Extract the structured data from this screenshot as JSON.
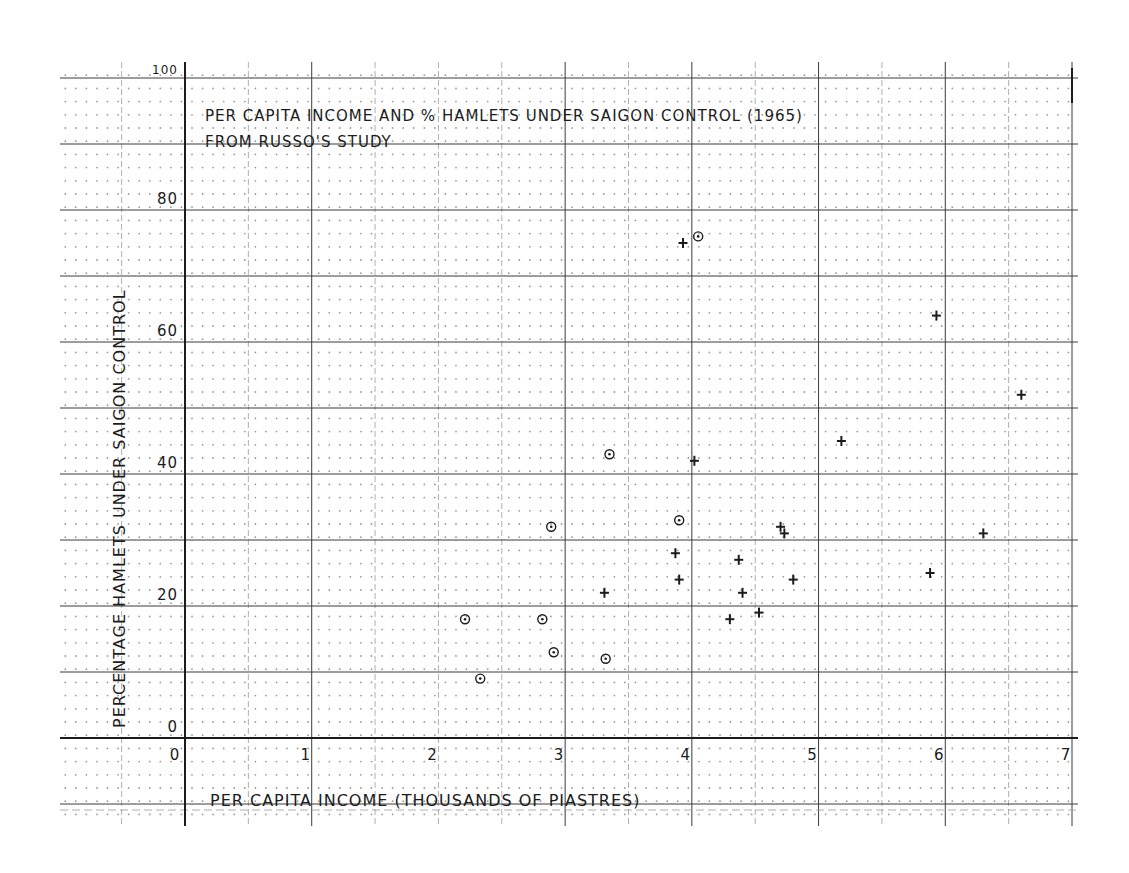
{
  "chart_data": {
    "type": "scatter",
    "title": "PER CAPITA INCOME AND % HAMLETS UNDER SAIGON CONTROL (1965)",
    "subtitle": "FROM RUSSO'S STUDY",
    "xlabel": "PER CAPITA INCOME   (THOUSANDS OF PIASTRES)",
    "ylabel": "PERCENTAGE HAMLETS UNDER SAIGON CONTROL",
    "xlim": [
      0,
      7
    ],
    "ylim": [
      0,
      100
    ],
    "x_ticks": [
      "0",
      "1",
      "2",
      "3",
      "4",
      "5",
      "6",
      "7"
    ],
    "y_ticks": [
      "0",
      "20",
      "40",
      "60",
      "80",
      "100"
    ],
    "grid": true,
    "legend": null,
    "series": [
      {
        "name": "circle-markers",
        "marker": "circle",
        "points": [
          {
            "x": 2.21,
            "y": 18
          },
          {
            "x": 2.33,
            "y": 9
          },
          {
            "x": 2.82,
            "y": 18
          },
          {
            "x": 2.89,
            "y": 32
          },
          {
            "x": 2.91,
            "y": 13
          },
          {
            "x": 3.32,
            "y": 12
          },
          {
            "x": 3.35,
            "y": 43
          },
          {
            "x": 3.9,
            "y": 33
          },
          {
            "x": 4.05,
            "y": 76
          }
        ]
      },
      {
        "name": "plus-markers",
        "marker": "plus",
        "points": [
          {
            "x": 3.31,
            "y": 22
          },
          {
            "x": 3.87,
            "y": 28
          },
          {
            "x": 3.9,
            "y": 24
          },
          {
            "x": 3.93,
            "y": 75
          },
          {
            "x": 4.02,
            "y": 42
          },
          {
            "x": 4.3,
            "y": 18
          },
          {
            "x": 4.37,
            "y": 27
          },
          {
            "x": 4.4,
            "y": 22
          },
          {
            "x": 4.53,
            "y": 19
          },
          {
            "x": 4.7,
            "y": 32
          },
          {
            "x": 4.73,
            "y": 31
          },
          {
            "x": 4.8,
            "y": 24
          },
          {
            "x": 5.18,
            "y": 45
          },
          {
            "x": 5.88,
            "y": 25
          },
          {
            "x": 5.93,
            "y": 64
          },
          {
            "x": 6.3,
            "y": 31
          },
          {
            "x": 6.6,
            "y": 52
          }
        ]
      }
    ]
  },
  "colors": {
    "ink": "#1c1c1c",
    "grid_major": "#3a3a3a",
    "grid_minor": "#9a9a9a",
    "paper": "#ffffff"
  }
}
